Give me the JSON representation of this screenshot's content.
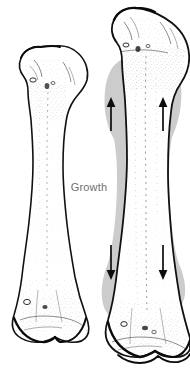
{
  "figure": {
    "caption_label": "Growth",
    "background_color": "#ffffff",
    "ink_color": "#111111",
    "shadow_color": "#c9c9c9",
    "stipple_color": "#555555",
    "label_color": "#6f6f6f",
    "canvas": {
      "width": 190,
      "height": 382
    }
  },
  "labels": {
    "growth": "Growth"
  },
  "bones": [
    {
      "id": "bone-before",
      "name": "immature-long-bone",
      "side": "left",
      "description": "Shorter long bone before growth",
      "has_growth_shadow": false,
      "bounds": {
        "x": 10,
        "y": 46,
        "width": 78,
        "height": 300
      }
    },
    {
      "id": "bone-after",
      "name": "mature-long-bone",
      "side": "right",
      "description": "Longer long bone after growth with gray silhouette of prior size",
      "has_growth_shadow": true,
      "bounds": {
        "x": 100,
        "y": 4,
        "width": 86,
        "height": 374
      }
    }
  ],
  "arrows": [
    {
      "id": "arrow-proximal-left",
      "direction": "up",
      "x": 111,
      "y_top": 98,
      "y_bottom": 131
    },
    {
      "id": "arrow-proximal-right",
      "direction": "up",
      "x": 163,
      "y_top": 98,
      "y_bottom": 131
    },
    {
      "id": "arrow-distal-left",
      "direction": "down",
      "x": 111,
      "y_top": 245,
      "y_bottom": 279
    },
    {
      "id": "arrow-distal-right",
      "direction": "down",
      "x": 163,
      "y_top": 245,
      "y_bottom": 279
    }
  ]
}
